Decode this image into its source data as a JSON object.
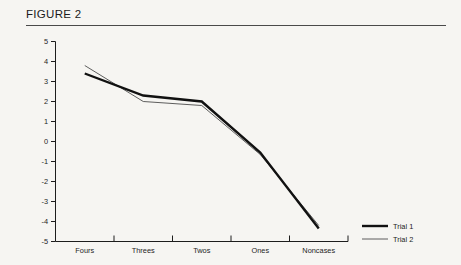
{
  "figure": {
    "title": "FIGURE 2"
  },
  "chart_data": {
    "type": "line",
    "title": "FIGURE 2",
    "xlabel": "",
    "ylabel": "",
    "categories": [
      "Fours",
      "Threes",
      "Twos",
      "Ones",
      "Noncases"
    ],
    "ylim": [
      -5,
      5
    ],
    "yticks": [
      "5",
      "4",
      "3",
      "2",
      "1",
      "0",
      "-1",
      "-2",
      "-3",
      "-4",
      "-5"
    ],
    "ytick_values": [
      5,
      4,
      3,
      2,
      1,
      0,
      -1,
      -2,
      -3,
      -4,
      -5
    ],
    "grid": false,
    "legend_position": "right-bottom",
    "series": [
      {
        "name": "Trial 1",
        "values": [
          3.4,
          2.3,
          2.0,
          -0.55,
          -4.35
        ],
        "style": "thick",
        "color": "#111111",
        "width": 2.4
      },
      {
        "name": "Trial 2",
        "values": [
          3.8,
          2.0,
          1.8,
          -0.65,
          -4.2
        ],
        "style": "thin",
        "color": "#4c4c4c",
        "width": 0.9
      }
    ]
  },
  "legend": {
    "items": [
      {
        "label": "Trial 1"
      },
      {
        "label": "Trial 2"
      }
    ]
  }
}
